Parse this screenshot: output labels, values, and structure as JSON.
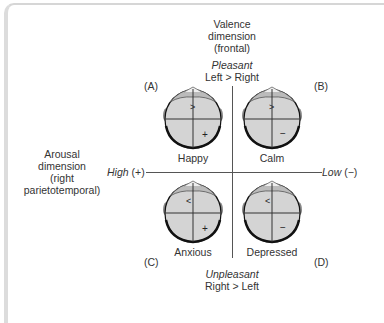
{
  "valence_axis": {
    "title_lines": [
      "Valence",
      "dimension",
      "(frontal)"
    ],
    "top_label": "Pleasant",
    "top_sublabel": "Left > Right",
    "bottom_label": "Unpleasant",
    "bottom_sublabel": "Right > Left"
  },
  "arousal_axis": {
    "title_lines": [
      "Arousal",
      "dimension",
      "(right",
      "parietotemporal)"
    ],
    "left_label": "High",
    "left_sign": "(+)",
    "right_label": "Low",
    "right_sign": "(−)"
  },
  "quadrants": [
    {
      "letter": "(A)",
      "emotion": "Happy",
      "frontal_symbol": ">",
      "parietal_symbol": "+"
    },
    {
      "letter": "(B)",
      "emotion": "Calm",
      "frontal_symbol": ">",
      "parietal_symbol": "−"
    },
    {
      "letter": "(C)",
      "emotion": "Anxious",
      "frontal_symbol": "<",
      "parietal_symbol": "+"
    },
    {
      "letter": "(D)",
      "emotion": "Depressed",
      "frontal_symbol": "<",
      "parietal_symbol": "−"
    }
  ],
  "colors": {
    "head_fill": "#d4d4d4",
    "head_outline": "#111111",
    "line": "#555555",
    "frame": "#d6d6d6"
  }
}
